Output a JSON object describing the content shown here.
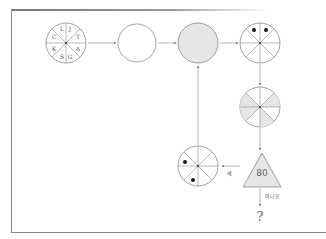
{
  "diagram": {
    "start_circle": {
      "segments": [
        "J",
        "T",
        "A",
        "G",
        "S",
        "K",
        "C",
        "L"
      ]
    },
    "triangle_value": "80",
    "yes_label": "예",
    "no_label": "아니오",
    "result": "?"
  },
  "colors": {
    "stroke": "#8a8a8a",
    "fill_gray": "#e6e6e6",
    "dot": "#1a1a1a"
  }
}
